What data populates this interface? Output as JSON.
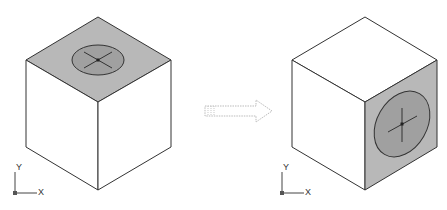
{
  "diagram": {
    "colors": {
      "face_shaded": "#b8b8b8",
      "ellipse_fill": "#a0a0a0",
      "stroke": "#333333",
      "background": "#ffffff",
      "arrow": "#999999"
    },
    "left_figure": {
      "name": "cube-before",
      "shaded_face": "top",
      "ucs_labels": {
        "x": "X",
        "y": "Y"
      }
    },
    "arrow": {
      "direction": "right",
      "style": "dotted"
    },
    "right_figure": {
      "name": "cube-after",
      "shaded_face": "right",
      "ucs_labels": {
        "x": "X",
        "y": "Y"
      }
    }
  }
}
